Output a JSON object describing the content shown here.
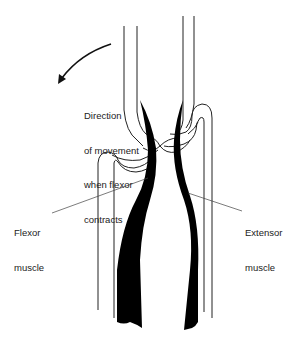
{
  "diagram": {
    "type": "anatomical-schematic",
    "labels": {
      "direction_line1": "Direction",
      "direction_line2": "of movement",
      "direction_line3": "when flexor",
      "direction_line4": "contracts",
      "flexor_line1": "Flexor",
      "flexor_line2": "muscle",
      "extensor_line1": "Extensor",
      "extensor_line2": "muscle"
    },
    "colors": {
      "background": "#ffffff",
      "outline": "#222222",
      "muscle": "#000000"
    }
  }
}
